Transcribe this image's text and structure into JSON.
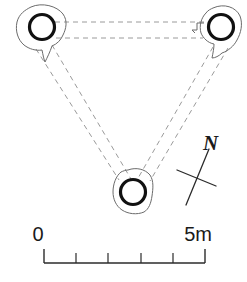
{
  "figure": {
    "type": "archaeological-site-plan",
    "background_color": "#ffffff"
  },
  "features": [
    {
      "id": "feature-top-left",
      "label": "",
      "center_x": 42,
      "center_y": 27,
      "ring_radius": 12.5,
      "ring_color": "#111111"
    },
    {
      "id": "feature-top-right",
      "label": "",
      "center_x": 221,
      "center_y": 27,
      "ring_radius": 12.5,
      "ring_color": "#111111"
    },
    {
      "id": "feature-bottom-center",
      "label": "",
      "center_x": 133,
      "center_y": 192,
      "ring_radius": 12.5,
      "ring_color": "#111111"
    }
  ],
  "sightlines": {
    "style": "dashed",
    "color": "#9a9a9a",
    "pairs": [
      "top-left to top-right",
      "top-left to bottom-center",
      "top-right to bottom-center"
    ]
  },
  "north_arrow": {
    "label": "N",
    "center_x": 197,
    "center_y": 178,
    "color": "#2b2b2b"
  },
  "scale_bar": {
    "left_label": "0",
    "right_label": "5m",
    "unit": "m",
    "total_length_m": 5,
    "divisions": 5,
    "bar_left_x": 44,
    "bar_right_x": 205,
    "bar_y": 263,
    "color": "#2b2b2b"
  }
}
